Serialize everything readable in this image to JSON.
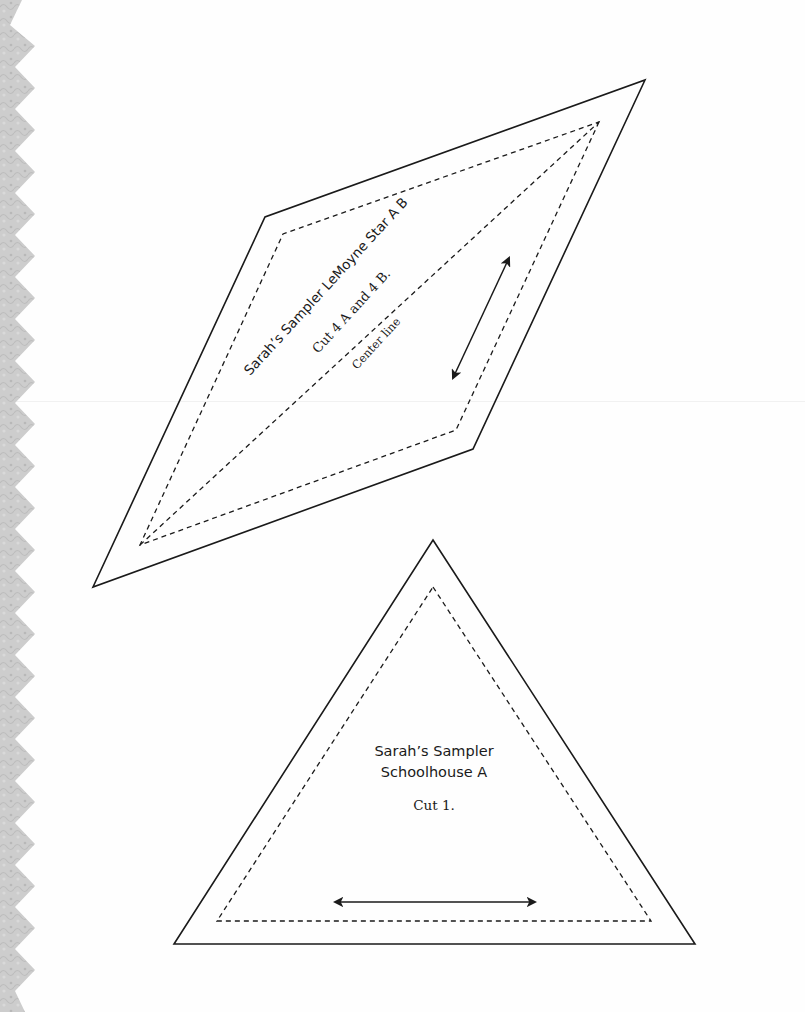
{
  "page": {
    "background": "#ffffff",
    "border_color": "#c8c8c8",
    "ink_color": "#1a1a1a"
  },
  "templates": [
    {
      "id": "lemoyne-star",
      "shape": "diamond",
      "title": "Sarah’s Sampler LeMoyne Star A B",
      "cut_instruction": "Cut 4 A and 4 B.",
      "center_label": "Center line",
      "has_grain_arrow": true
    },
    {
      "id": "schoolhouse",
      "shape": "triangle",
      "title_line_1": "Sarah’s Sampler",
      "title_line_2": "Schoolhouse A",
      "cut_instruction": "Cut 1.",
      "has_grain_arrow": true
    }
  ]
}
